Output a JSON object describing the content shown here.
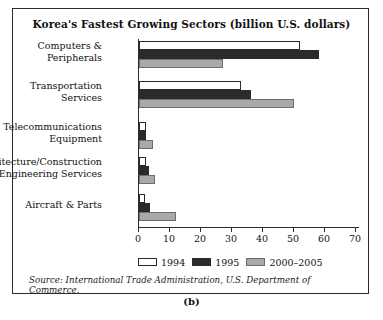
{
  "figure": {
    "title": "Korea's Fastest Growing Sectors (billion U.S. dollars)",
    "source": "Source: International Trade Administration, U.S. Department of Commerce.",
    "caption": "(b)"
  },
  "legend": {
    "items": [
      {
        "label": "1994",
        "color": "#ffffff"
      },
      {
        "label": "1995",
        "color": "#2b2b2b"
      },
      {
        "label": "2000–2005",
        "color": "#a9a9a9"
      }
    ]
  },
  "axis": {
    "ticks": [
      "0",
      "10",
      "20",
      "30",
      "40",
      "50",
      "60",
      "70"
    ]
  },
  "chart_data": {
    "type": "bar",
    "orientation": "horizontal",
    "title": "Korea's Fastest Growing Sectors (billion U.S. dollars)",
    "xlabel": "",
    "ylabel": "",
    "xlim": [
      0,
      70
    ],
    "xticks": [
      0,
      10,
      20,
      30,
      40,
      50,
      60,
      70
    ],
    "grid": false,
    "legend_position": "bottom",
    "categories": [
      "Computers & Peripherals",
      "Transportation Services",
      "Telecommunications Equipment",
      "Architecture/Construction Engineering Services",
      "Aircraft & Parts"
    ],
    "series": [
      {
        "name": "1994",
        "color": "#ffffff",
        "values": [
          52,
          33,
          2.3,
          2.3,
          2
        ]
      },
      {
        "name": "1995",
        "color": "#2b2b2b",
        "values": [
          58,
          36,
          2.3,
          3.2,
          3.5
        ]
      },
      {
        "name": "2000–2005",
        "color": "#a9a9a9",
        "values": [
          27,
          50,
          4.5,
          5,
          12
        ]
      }
    ]
  },
  "groups": [
    {
      "label_line1": "Computers &",
      "label_line2": "Peripherals",
      "bars": [
        {
          "series": "1994",
          "value": 52
        },
        {
          "series": "1995",
          "value": 58
        },
        {
          "series": "2000–2005",
          "value": 27
        }
      ]
    },
    {
      "label_line1": "Transportation",
      "label_line2": "Services",
      "bars": [
        {
          "series": "1994",
          "value": 33
        },
        {
          "series": "1995",
          "value": 36
        },
        {
          "series": "2000–2005",
          "value": 50
        }
      ]
    },
    {
      "label_line1": "Telecommunications",
      "label_line2": "Equipment",
      "bars": [
        {
          "series": "1994",
          "value": 2.3
        },
        {
          "series": "1995",
          "value": 2.3
        },
        {
          "series": "2000–2005",
          "value": 4.5
        }
      ]
    },
    {
      "label_line1": "Architecture/Construction",
      "label_line2": "Engineering Services",
      "bars": [
        {
          "series": "1994",
          "value": 2.3
        },
        {
          "series": "1995",
          "value": 3.2
        },
        {
          "series": "2000–2005",
          "value": 5
        }
      ]
    },
    {
      "label_line1": "Aircraft & Parts",
      "label_line2": "",
      "bars": [
        {
          "series": "1994",
          "value": 2
        },
        {
          "series": "1995",
          "value": 3.5
        },
        {
          "series": "2000–2005",
          "value": 12
        }
      ]
    }
  ]
}
